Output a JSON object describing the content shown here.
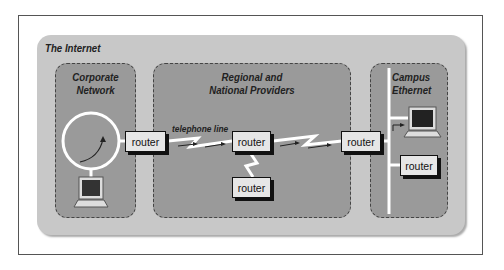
{
  "diagram": {
    "title": "The Internet",
    "regions": [
      {
        "id": "corporate",
        "label_line1": "Corporate",
        "label_line2": "Network"
      },
      {
        "id": "regional",
        "label_line1": "Regional and",
        "label_line2": "National Providers"
      },
      {
        "id": "campus",
        "label_line1": "Campus",
        "label_line2": "Ethernet"
      }
    ],
    "routers": [
      {
        "id": "corporate-router",
        "label": "router"
      },
      {
        "id": "regional-router-1",
        "label": "router"
      },
      {
        "id": "regional-router-2",
        "label": "router"
      },
      {
        "id": "border-router",
        "label": "router"
      },
      {
        "id": "campus-router",
        "label": "router"
      }
    ],
    "link_label": "telephone line",
    "colors": {
      "outer_background": "#c8c8c8",
      "region_background": "#9a9a9a",
      "router_fill": "#e6e6e6",
      "link_color": "#ffffff"
    }
  }
}
